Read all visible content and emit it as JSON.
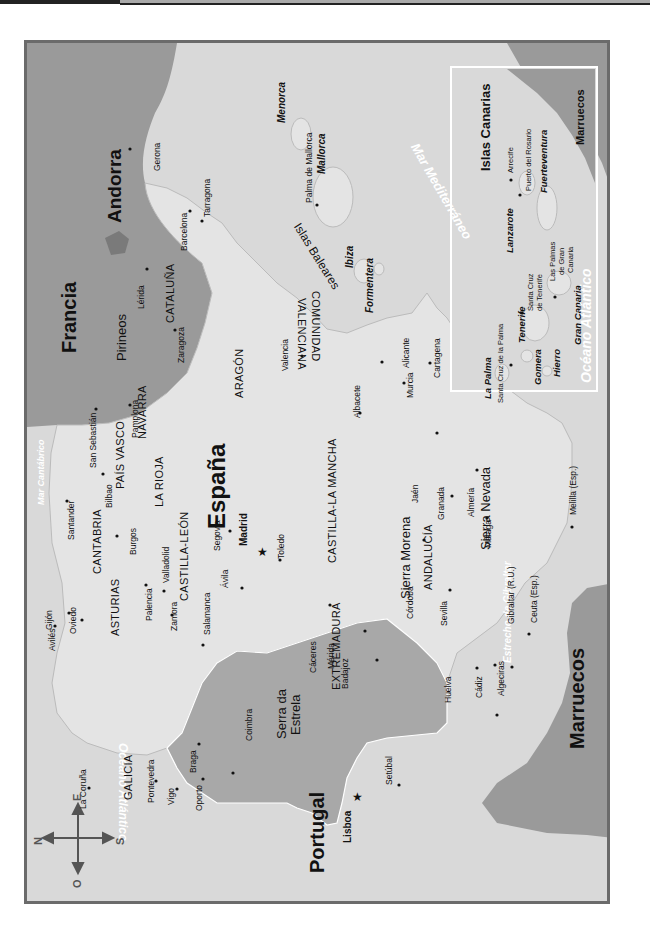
{
  "map": {
    "title": "España",
    "orientation": "rotated 90° counter-clockwise",
    "colors": {
      "sea": "#d9d9d9",
      "spain_land": "#e4e4e4",
      "portugal_land": "#a8a8a8",
      "foreign_land": "#9a9a9a",
      "andorra": "#7a7a7a",
      "frame": "#6b6b6b",
      "sea_label": "#ffffff"
    },
    "countries": {
      "spain": "España",
      "portugal": "Portugal",
      "france": "Francia",
      "andorra": "Andorra",
      "morocco": "Marruecos",
      "morocco_inset": "Marruecos"
    },
    "seas": {
      "atlantic_left": "Océano Atlántico",
      "cantabrico": "Mar Cantábrico",
      "mediterraneo": "Mar Mediterráneo",
      "gibraltar_strait": "Estrecho de Gibraltar",
      "atlantic_inset": "Océano Atlántico"
    },
    "mountains": {
      "pirineos": "Pirineos",
      "sierra_morena": "Sierra Morena",
      "sierra_nevada": "Sierra Nevada",
      "serra_estrela": "Serra da Estrela"
    },
    "regions": {
      "galicia": "GALICIA",
      "asturias": "ASTURIAS",
      "cantabria": "CANTABRIA",
      "pais_vasco": "PAÍS VASCO",
      "navarra": "NAVARRA",
      "la_rioja": "LA RIOJA",
      "aragon": "ARAGÓN",
      "cataluna": "CATALUÑA",
      "castilla_leon": "CASTILLA-LEÓN",
      "castilla_la_mancha": "CASTILLA-LA MANCHA",
      "extremadura": "EXTREMADURA",
      "andalucia": "ANDALUCÍA",
      "comunidad": "COMUNIDAD",
      "valenciana": "VALENCIANA"
    },
    "capitals": {
      "madrid": "Madrid",
      "lisboa": "Lisboa"
    },
    "cities": {
      "gerona": "Gerona",
      "barcelona": "Barcelona",
      "tarragona": "Tarragona",
      "lerida": "Lérida",
      "zaragoza": "Zaragoza",
      "pamplona": "Pamplona",
      "san_sebastian": "San Sebastián",
      "bilbao": "Bilbao",
      "santander": "Santander",
      "burgos": "Burgos",
      "gijon": "Gijón",
      "oviedo": "Oviedo",
      "aviles": "Avilés",
      "palencia": "Palencia",
      "valladolid": "Valladolid",
      "zamora": "Zamora",
      "salamanca": "Salamanca",
      "segovia": "Segovia",
      "avila": "Ávila",
      "toledo": "Toledo",
      "caceres": "Cáceres",
      "merida": "Mérida",
      "badajoz": "Badajoz",
      "valencia": "Valencia",
      "albacete": "Albacete",
      "alicante": "Alicante",
      "murcia": "Murcia",
      "cartagena": "Cartagena",
      "jaen": "Jaén",
      "granada": "Granada",
      "almeria": "Almería",
      "cordoba": "Córdoba",
      "sevilla": "Sevilla",
      "malaga": "Málaga",
      "huelva": "Huelva",
      "cadiz": "Cádiz",
      "algeciras": "Algeciras",
      "gibraltar": "Gibraltar (R.U.)",
      "ceuta": "Ceuta (Esp.)",
      "melilla": "Melilla (Esp.)",
      "la_coruna": "La Coruña",
      "pontevedra": "Pontevedra",
      "vigo": "Vigo",
      "braga": "Braga",
      "oporto": "Oporto",
      "coimbra": "Coimbra",
      "setubal": "Setúbal",
      "palma": "Palma de Mallorca"
    },
    "baleares": {
      "group": "Islas Baleares",
      "menorca": "Menorca",
      "mallorca": "Mallorca",
      "ibiza": "Ibiza",
      "formentera": "Formentera"
    },
    "canarias": {
      "title": "Islas Canarias",
      "la_palma": "La Palma",
      "santa_cruz_palma": "Santa Cruz de la Palma",
      "tenerife": "Tenerife",
      "santa_cruz_tenerife_1": "Santa Cruz",
      "santa_cruz_tenerife_2": "de Tenerife",
      "gomera": "Gomera",
      "hierro": "Hierro",
      "gran_canaria": "Gran Canaria",
      "las_palmas_1": "Las Palmas",
      "las_palmas_2": "de Gran",
      "las_palmas_3": "Canaria",
      "lanzarote": "Lanzarote",
      "arrecife": "Arrecife",
      "fuerteventura": "Fuerteventura",
      "puerto_rosario": "Puerto del Rosario"
    },
    "compass": {
      "north": "N",
      "south": "S",
      "east": "E",
      "west": "O"
    }
  }
}
